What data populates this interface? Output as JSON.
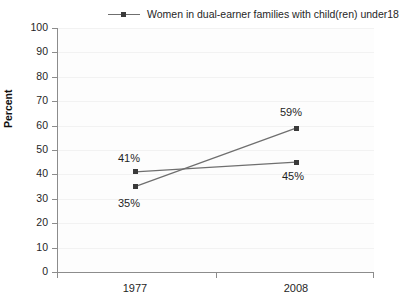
{
  "chart_data": {
    "type": "line",
    "title": "",
    "xlabel": "",
    "ylabel": "Percent",
    "categories": [
      "1977",
      "2008"
    ],
    "ylim": [
      0,
      100
    ],
    "ytick_values": [
      0,
      10,
      20,
      30,
      40,
      50,
      60,
      70,
      80,
      90,
      100
    ],
    "ytick_labels": [
      "0",
      "10",
      "20",
      "30",
      "40",
      "50",
      "60",
      "70",
      "80",
      "90",
      "100"
    ],
    "grid": true,
    "legend_position": "top",
    "series": [
      {
        "name": "Women in dual-earner families with child(ren) under18",
        "values": [
          35,
          59
        ],
        "point_labels": [
          "35%",
          "59%"
        ],
        "color": "#6f6f6f",
        "marker_color": "#3a3a3a"
      },
      {
        "name": "",
        "values": [
          41,
          45
        ],
        "point_labels": [
          "41%",
          "45%"
        ],
        "color": "#6f6f6f",
        "marker_color": "#3a3a3a"
      }
    ],
    "annotations": [
      "41%",
      "35%",
      "59%",
      "45%"
    ]
  },
  "legend": {
    "entries": [
      {
        "label": ""
      },
      {
        "label": "Women in dual-earner families with child(ren) under18"
      }
    ]
  },
  "colors": {
    "line": "#6f6f6f",
    "marker": "#3a3a3a",
    "axis": "#8c8c8c",
    "grid": "#f2f2f2",
    "text": "#1f1f1f",
    "plot_background": "#fdfdfd"
  }
}
